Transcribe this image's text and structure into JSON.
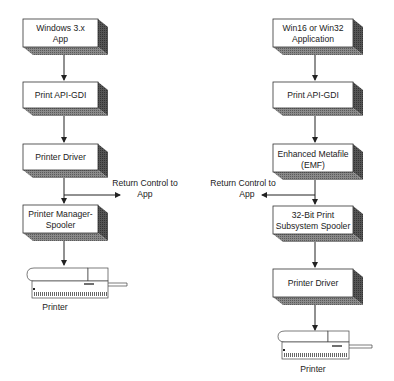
{
  "left_flow": {
    "boxes": [
      {
        "line1": "Windows 3.x",
        "line2": "App"
      },
      {
        "line1": "Print API-GDI",
        "line2": ""
      },
      {
        "line1": "Printer Driver",
        "line2": ""
      },
      {
        "line1": "Printer Manager-",
        "line2": "Spooler"
      }
    ],
    "return_label": {
      "line1": "Return Control to",
      "line2": "App"
    },
    "printer_label": "Printer"
  },
  "right_flow": {
    "boxes": [
      {
        "line1": "Win16 or Win32",
        "line2": "Application"
      },
      {
        "line1": "Print API-GDI",
        "line2": ""
      },
      {
        "line1": "Enhanced Metafile",
        "line2": "(EMF)"
      },
      {
        "line1": "32-Bit Print",
        "line2": "Subsystem Spooler"
      },
      {
        "line1": "Printer Driver",
        "line2": ""
      }
    ],
    "return_label": {
      "line1": "Return Control to",
      "line2": "App"
    },
    "printer_label": "Printer"
  },
  "colors": {
    "box_face": "#ffffff",
    "box_side": "#4a4a4a",
    "box_bottom": "#7a7a7a",
    "line": "#222222"
  }
}
